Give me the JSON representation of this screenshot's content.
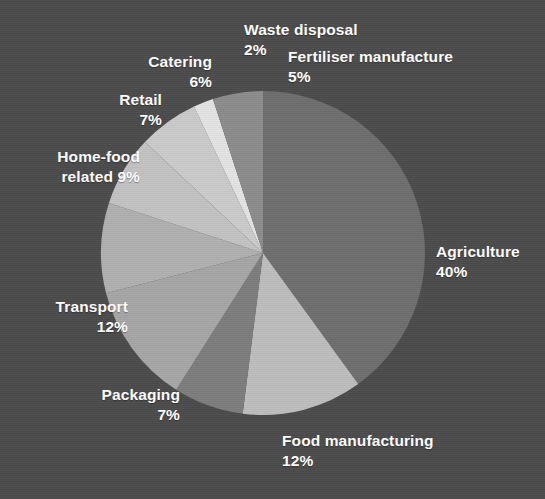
{
  "chart_data": {
    "type": "pie",
    "title": "",
    "subtitle": "",
    "xlabel": "",
    "ylabel": "",
    "legend_position": "none",
    "grid": false,
    "units": "percent",
    "total": 100,
    "categories": [
      "Agriculture",
      "Food manufacturing",
      "Packaging",
      "Transport",
      "Home-food related",
      "Retail",
      "Catering",
      "Waste disposal",
      "Fertiliser manufacture"
    ],
    "values": [
      40,
      12,
      7,
      12,
      9,
      7,
      6,
      2,
      5
    ],
    "slices": [
      {
        "label": "Agriculture",
        "value": 40,
        "value_text": "40%",
        "label_text": "Agriculture\n40%",
        "color": "#6e6e6e"
      },
      {
        "label": "Food manufacturing",
        "value": 12,
        "value_text": "12%",
        "label_text": "Food manufacturing\n12%",
        "color": "#bdbdbd"
      },
      {
        "label": "Packaging",
        "value": 7,
        "value_text": "7%",
        "label_text": "Packaging\n7%",
        "color": "#7d7d7d"
      },
      {
        "label": "Transport",
        "value": 12,
        "value_text": "12%",
        "label_text": "Transport\n12%",
        "color": "#a6a6a6"
      },
      {
        "label": "Home-food related",
        "value": 9,
        "value_text": "9%",
        "label_text": "Home-food\nrelated 9%",
        "color": "#b0b0b0"
      },
      {
        "label": "Retail",
        "value": 7,
        "value_text": "7%",
        "label_text": "Retail\n7%",
        "color": "#c2c2c2"
      },
      {
        "label": "Catering",
        "value": 6,
        "value_text": "6%",
        "label_text": "Catering\n6%",
        "color": "#cbcbcb"
      },
      {
        "label": "Waste disposal",
        "value": 2,
        "value_text": "2%",
        "label_text": "Waste disposal\n2%",
        "color": "#e3e3e3"
      },
      {
        "label": "Fertiliser manufacture",
        "value": 5,
        "value_text": "5%",
        "label_text": "Fertiliser manufacture\n5%",
        "color": "#8c8c8c"
      }
    ],
    "background_color": "#4b4b4b",
    "label_color": "#ffffff",
    "start_angle_deg": 0,
    "direction": "clockwise",
    "center": {
      "x": 263,
      "y": 253
    },
    "radius": 162
  }
}
